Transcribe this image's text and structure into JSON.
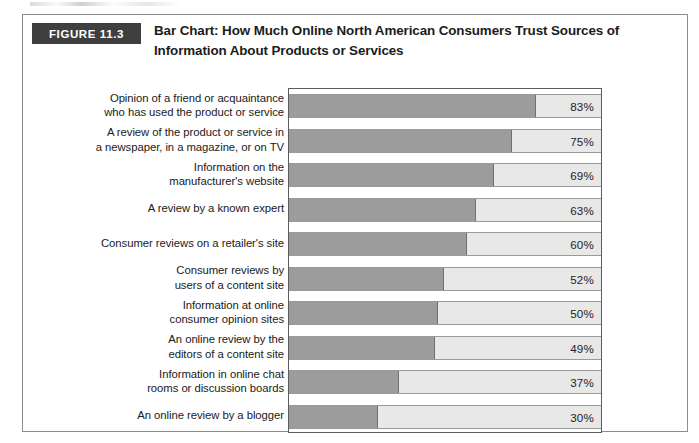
{
  "figure": {
    "tag": "FIGURE 11.3",
    "title_line1": "Bar Chart: How Much Online North American Consumers Trust Sources",
    "title_line2": "of Information About Products or Services"
  },
  "colors": {
    "tag_background": "#3f3f3f",
    "tag_text": "#ffffff",
    "bar_fill": "#9c9c9c",
    "bar_track": "#e8e8e8",
    "plot_border": "#5c5c5c",
    "frame_border": "#8d8d90",
    "text": "#1a1a1a"
  },
  "chart_data": {
    "type": "bar",
    "orientation": "horizontal",
    "title": "Bar Chart: How Much Online North American Consumers Trust Sources of Information About Products or Services",
    "xlabel": "",
    "ylabel": "",
    "xlim": [
      0,
      105
    ],
    "grid": false,
    "legend": "none",
    "value_suffix": "%",
    "categories": [
      "Opinion of a friend or acquaintance who has used the product or service",
      "A review of the product or service in a newspaper, in a magazine, or on TV",
      "Information on the manufacturer's website",
      "A review by a known expert",
      "Consumer reviews on a retailer's site",
      "Consumer reviews by users of a content site",
      "Information at online consumer opinion sites",
      "An online review by the editors of a content site",
      "Information in online chat rooms or discussion boards",
      "An online review by a blogger"
    ],
    "values": [
      83,
      75,
      69,
      63,
      60,
      52,
      50,
      49,
      37,
      30
    ],
    "value_labels": [
      "83%",
      "75%",
      "69%",
      "63%",
      "60%",
      "52%",
      "50%",
      "49%",
      "37%",
      "30%"
    ]
  },
  "rows": [
    {
      "label_lines": [
        "Opinion of a friend or acquaintance",
        "who has used the product or service"
      ],
      "value": 83,
      "value_label": "83%"
    },
    {
      "label_lines": [
        "A review of the product or service in",
        "a newspaper, in a magazine, or on TV"
      ],
      "value": 75,
      "value_label": "75%"
    },
    {
      "label_lines": [
        "Information on the",
        "manufacturer's website"
      ],
      "value": 69,
      "value_label": "69%"
    },
    {
      "label_lines": [
        "A review by a known expert"
      ],
      "value": 63,
      "value_label": "63%"
    },
    {
      "label_lines": [
        "Consumer reviews on a retailer's site"
      ],
      "value": 60,
      "value_label": "60%"
    },
    {
      "label_lines": [
        "Consumer reviews by",
        "users of a content site"
      ],
      "value": 52,
      "value_label": "52%"
    },
    {
      "label_lines": [
        "Information at online",
        "consumer opinion sites"
      ],
      "value": 50,
      "value_label": "50%"
    },
    {
      "label_lines": [
        "An online review by the",
        "editors of a content site"
      ],
      "value": 49,
      "value_label": "49%"
    },
    {
      "label_lines": [
        "Information in online chat",
        "rooms or discussion boards"
      ],
      "value": 37,
      "value_label": "37%"
    },
    {
      "label_lines": [
        "An online review by a blogger"
      ],
      "value": 30,
      "value_label": "30%"
    }
  ]
}
